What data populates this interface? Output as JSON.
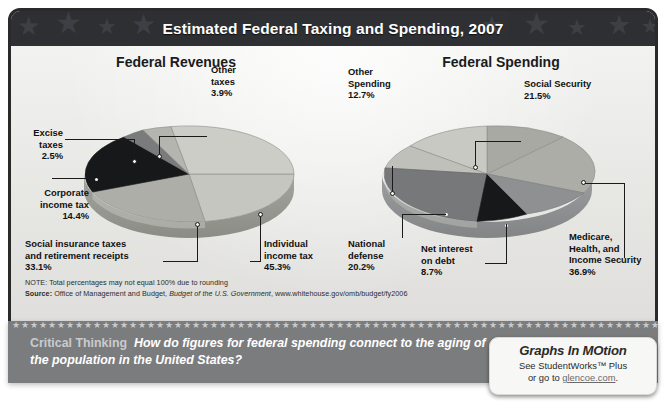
{
  "header": {
    "title": "Estimated Federal Taxing and Spending, 2007"
  },
  "charts": {
    "left": {
      "title": "Federal Revenues"
    },
    "right": {
      "title": "Federal Spending"
    }
  },
  "labels": {
    "excise": "Excise\ntaxes\n2.5%",
    "other_taxes": "Other\ntaxes\n3.9%",
    "corporate": "Corporate\nincome tax\n14.4%",
    "social_insurance": "Social insurance taxes\nand retirement receipts\n33.1%",
    "individual": "Individual\nincome tax\n45.3%",
    "other_spending": "Other\nSpending\n12.7%",
    "social_security": "Social Security\n21.5%",
    "medicare": "Medicare,\nHealth, and\nIncome Security\n36.9%",
    "net_interest": "Net interest\non debt\n8.7%",
    "national_defense": "National\ndefense\n20.2%"
  },
  "notes": {
    "note": "NOTE: Total percentages may not equal 100% due to rounding",
    "source_label": "Source:",
    "source_text_1": " Office of Management and Budget, ",
    "source_italic": "Budget of the U.S. Government",
    "source_text_2": ", www.whitehouse.gov/omb/budget/fy2006"
  },
  "critical_thinking": {
    "label": "Critical Thinking",
    "question": "How do figures for federal spending connect to the aging of the population in the United States?"
  },
  "badge": {
    "title": "Graphs In MOtion",
    "line1": "See StudentWorks™ Plus",
    "line2_prefix": "or go to ",
    "link": "glencoe.com",
    "line2_suffix": "."
  },
  "colors": {
    "banner_bg": "#2f3033",
    "panel_bg": "#e9e9e7",
    "strip_bg": "#7b7c7e",
    "slice_light": "#cfcfcb",
    "slice_mid": "#a8a8a3",
    "slice_dark": "#6e6f70",
    "slice_black": "#17181a",
    "slice_midlight": "#bdbdb8"
  },
  "chart_data": [
    {
      "type": "pie",
      "title": "Federal Revenues",
      "categories": [
        "Individual income tax",
        "Social insurance taxes and retirement receipts",
        "Corporate income tax",
        "Other taxes",
        "Excise taxes"
      ],
      "values": [
        45.3,
        33.1,
        14.4,
        3.9,
        2.5
      ],
      "unit": "%",
      "legend": "none",
      "note": "Total percentages may not equal 100% due to rounding"
    },
    {
      "type": "pie",
      "title": "Federal Spending",
      "categories": [
        "Medicare, Health, and Income Security",
        "Social Security",
        "National defense",
        "Other Spending",
        "Net interest on debt"
      ],
      "values": [
        36.9,
        21.5,
        20.2,
        12.7,
        8.7
      ],
      "unit": "%",
      "legend": "none",
      "note": "Total percentages may not equal 100% due to rounding"
    }
  ]
}
